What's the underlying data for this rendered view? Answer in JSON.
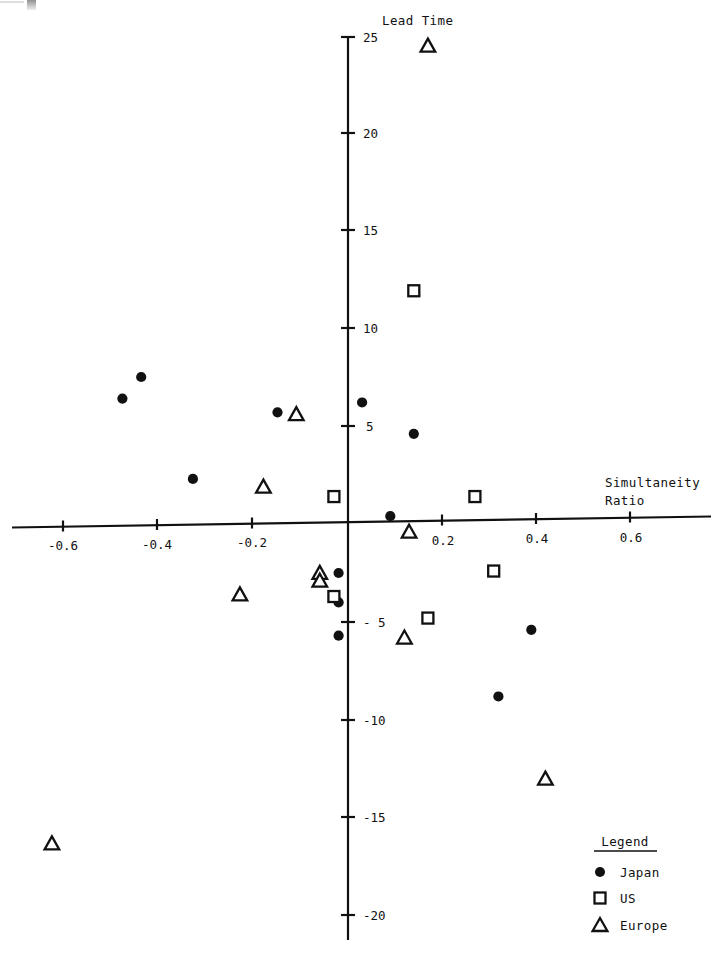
{
  "chart_data": {
    "type": "scatter",
    "title": "",
    "xlabel": "Simultaneity Ratio",
    "ylabel": "Lead Time",
    "xlim": [
      -0.72,
      0.79
    ],
    "ylim": [
      -21.5,
      25.5
    ],
    "xticks": [
      -0.6,
      -0.4,
      -0.2,
      0.2,
      0.4,
      0.6
    ],
    "xticklabels": [
      "-0.6",
      "-0.4",
      "-0.2",
      "0.2",
      "0.4",
      "0.6"
    ],
    "yticks": [
      25,
      20,
      15,
      10,
      5,
      -5,
      -10,
      -15,
      -20
    ],
    "yticklabels": [
      "25",
      "20",
      "15",
      "10",
      "5",
      "- 5",
      "-10",
      "-15",
      "-20"
    ],
    "grid": false,
    "legend_position": "bottom-right",
    "series": [
      {
        "name": "Japan",
        "marker": "filled-circle",
        "color": "#111111",
        "points": [
          {
            "x": -0.44,
            "y": 7.5
          },
          {
            "x": -0.48,
            "y": 6.4
          },
          {
            "x": -0.15,
            "y": 5.7
          },
          {
            "x": -0.33,
            "y": 2.3
          },
          {
            "x": 0.03,
            "y": 6.2
          },
          {
            "x": 0.14,
            "y": 4.6
          },
          {
            "x": 0.09,
            "y": 0.4
          },
          {
            "x": -0.02,
            "y": -2.5
          },
          {
            "x": -0.02,
            "y": -4.0
          },
          {
            "x": -0.02,
            "y": -5.7
          },
          {
            "x": 0.39,
            "y": -5.4
          },
          {
            "x": 0.32,
            "y": -8.8
          }
        ]
      },
      {
        "name": "US",
        "marker": "open-square",
        "color": "#111111",
        "points": [
          {
            "x": 0.14,
            "y": 11.9
          },
          {
            "x": -0.03,
            "y": 1.4
          },
          {
            "x": 0.27,
            "y": 1.4
          },
          {
            "x": -0.03,
            "y": -3.7
          },
          {
            "x": 0.31,
            "y": -2.4
          },
          {
            "x": 0.17,
            "y": -4.8
          }
        ]
      },
      {
        "name": "Europe",
        "marker": "open-triangle",
        "color": "#111111",
        "points": [
          {
            "x": 0.17,
            "y": 24.4
          },
          {
            "x": -0.11,
            "y": 5.6
          },
          {
            "x": -0.18,
            "y": 1.9
          },
          {
            "x": -0.23,
            "y": -3.6
          },
          {
            "x": -0.06,
            "y": -2.5
          },
          {
            "x": -0.06,
            "y": -2.9
          },
          {
            "x": 0.13,
            "y": -0.4
          },
          {
            "x": 0.12,
            "y": -5.8
          },
          {
            "x": 0.42,
            "y": -13.0
          },
          {
            "x": -0.63,
            "y": -16.3
          }
        ]
      }
    ]
  },
  "legend": {
    "title": "Legend",
    "entries": [
      {
        "label": "Japan",
        "marker": "filled-circle"
      },
      {
        "label": "US",
        "marker": "open-square"
      },
      {
        "label": "Europe",
        "marker": "open-triangle"
      }
    ]
  },
  "axes": {
    "y_title": "Lead Time",
    "x_title_line1": "Simultaneity",
    "x_title_line2": "Ratio"
  }
}
